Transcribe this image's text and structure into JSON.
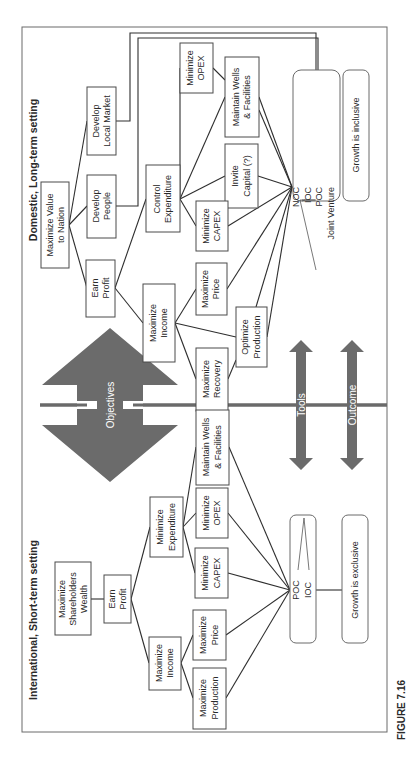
{
  "figure": {
    "caption": "FIGURE 7.16",
    "orientation": "rotated-90-ccw"
  },
  "domestic": {
    "title": "Domestic,  Long-term setting",
    "root": [
      "Maximize Value",
      "to Nation"
    ],
    "earn_profit": [
      "Earn",
      "Profit"
    ],
    "develop_people": [
      "Develop",
      "People"
    ],
    "develop_market": [
      "Develop",
      "Local Market"
    ],
    "control_expenditure": [
      "Control",
      "Expenditure"
    ],
    "maximize_income": [
      "Maximize",
      "Income"
    ],
    "minimize_opex": [
      "Minimize",
      "OPEX"
    ],
    "maintain_wells": [
      "Maintain Wells",
      "& Facilities"
    ],
    "invite_capital": [
      "Invite",
      "Capital (?)"
    ],
    "minimize_capex": [
      "Minimize",
      "CAPEX"
    ],
    "maximize_price": [
      "Maximize",
      "Price"
    ],
    "optimize_production": [
      "Optimize",
      "Production"
    ],
    "maximize_recovery": [
      "Maximize",
      "Recovery"
    ],
    "tools": [
      "NOC",
      "IOC",
      "POC",
      "Joint Venture"
    ],
    "outcome": "Growth is inclusive"
  },
  "international": {
    "title": "International,  Short-term setting",
    "root": [
      "Maximize",
      "Shareholders",
      "Wealth"
    ],
    "earn_profit": [
      "Earn",
      "Profit"
    ],
    "minimize_expenditure": [
      "Minimize",
      "Expenditure"
    ],
    "maximize_income": [
      "Maximize",
      "Income"
    ],
    "maintain_wells": [
      "Maintain Wells",
      "& Facilities"
    ],
    "minimize_opex": [
      "Minimize",
      "OPEX"
    ],
    "minimize_capex": [
      "Minimize",
      "CAPEX"
    ],
    "maximize_price": [
      "Maximize",
      "Price"
    ],
    "maximize_production": [
      "Maximize",
      "Production"
    ],
    "tools": [
      "POC",
      "IOC"
    ],
    "outcome": "Growth is exclusive"
  },
  "center": {
    "objectives_label": "Objectives",
    "tools_label": "Tools",
    "outcome_label": "Outcome"
  },
  "colors": {
    "arrow_fill": "#6b6b6b",
    "box_stroke": "#4a4a4a",
    "text": "#2a2a2a"
  }
}
